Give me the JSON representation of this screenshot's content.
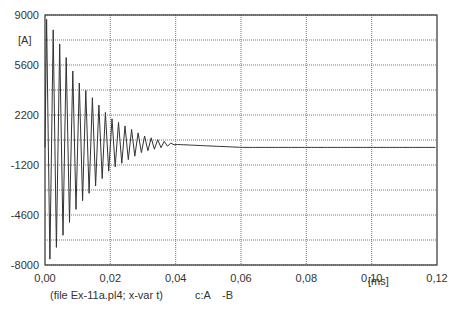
{
  "chart_data": {
    "type": "line",
    "title": "",
    "xlabel": "[ms]",
    "ylabel": "[A]",
    "xlim": [
      0.0,
      0.12
    ],
    "ylim": [
      -8000,
      9000
    ],
    "x_ticks": [
      "0,00",
      "0,02",
      "0,04",
      "0,06",
      "0,08",
      "0,10",
      "0,12"
    ],
    "y_ticks": [
      "9000",
      "5600",
      "2200",
      "-1200",
      "-4600",
      "-8000"
    ],
    "grid": true,
    "footer": "(file Ex-11a.pl4; x-var t)",
    "legend": [
      {
        "name": "c:A  -B",
        "color": "#333333"
      }
    ],
    "series": [
      {
        "name": "c:A -B",
        "description": "Damped oscillating current, initial peaks ~+8700/-7800 A decaying to ~0 A by 0.06 ms, then flat at ~0",
        "envelope": [
          {
            "t": 0.001,
            "max": 8700,
            "min": -7800
          },
          {
            "t": 0.005,
            "max": 6800,
            "min": -6200
          },
          {
            "t": 0.01,
            "max": 4500,
            "min": -4000
          },
          {
            "t": 0.02,
            "max": 2000,
            "min": -1500
          },
          {
            "t": 0.03,
            "max": 800,
            "min": -300
          },
          {
            "t": 0.04,
            "max": 200,
            "min": 200
          },
          {
            "t": 0.06,
            "max": 0,
            "min": 0
          },
          {
            "t": 0.12,
            "max": 0,
            "min": 0
          }
        ]
      }
    ]
  },
  "axis": {
    "y_unit": "[A]",
    "x_unit": "[ms]"
  },
  "footer": {
    "file": "(file Ex-11a.pl4; x-var t)",
    "c_label": "c:A",
    "b_label": "-B"
  }
}
